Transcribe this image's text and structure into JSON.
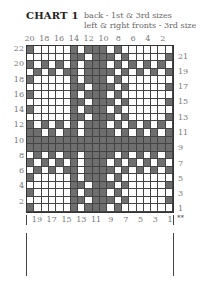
{
  "header": {
    "title": "CHART 1",
    "subtitle_line1": "back - 1st & 3rd sizes",
    "subtitle_line2": "left & right fronts - 3rd size"
  },
  "colors": {
    "dark": "#6e6e6e",
    "light": "#ffffff",
    "grid_line": "#444444"
  },
  "grid": {
    "columns": 20,
    "rows_count": 22,
    "legend": {
      "X": "contrast colour (dark)",
      ".": "main colour (light)"
    },
    "rows_top_to_bottom_col20_to_col1": [
      "X.....X.XXX.X.......",
      "......XX.XXX.X.....X",
      "X.X.X.X.XXX.X.X.X.X.",
      ".X.X.XX.XXXX.X.X.X.X",
      "X.....X.XXX.X.......",
      "......XX.XXX.X.....X",
      "X.....X.XXX.X.......",
      "......XX.XXX.X.....X",
      "X.....X.XXX.X.......",
      "......XX.XXX.X.....X",
      "X.X.X.X.XXX.X.X.X.X.",
      "XX.X.XX.XXXX.X.X.X.X",
      "XXXXXXXXXXXXXXXXXXXX",
      "XXXXXXXXXXXXXXXXXXXX",
      ".X.X.XX.XXXX.X.X.X.X",
      "X.X.X.X.XXX.X.X.X.X.",
      ".X.X.XX.XXXX.X.X.X.X",
      "X.....X.XXX.X.......",
      "......XX.XXX.X.....X",
      "X.....X.XXX.X.......",
      "......XX.XXX.X.....X",
      "X.....X.XXX.X.......",
      "......XX.XXX.X.....X"
    ]
  },
  "axis": {
    "top_labels": [
      "20",
      "18",
      "16",
      "14",
      "12",
      "10",
      "8",
      "6",
      "4",
      "2"
    ],
    "bottom_labels": [
      "19",
      "17",
      "15",
      "13",
      "11",
      "9",
      "7",
      "5",
      "3",
      "1"
    ],
    "left_labels": [
      "22",
      "20",
      "18",
      "16",
      "14",
      "12",
      "10",
      "8",
      "6",
      "4",
      "2"
    ],
    "right_labels": [
      "21",
      "19",
      "17",
      "15",
      "13",
      "11",
      "9",
      "7",
      "5",
      "3",
      "1"
    ],
    "marker": "**"
  }
}
